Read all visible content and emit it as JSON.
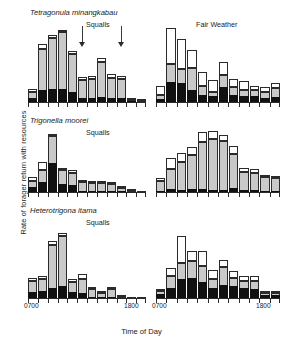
{
  "figure": {
    "ylabel": "Rate of forager return with resources",
    "xlabel": "Time of Day",
    "xtick_start": "0700",
    "xtick_end": "1800",
    "colors": {
      "pollen_black": "#111111",
      "nectar_gray": "#c9c9c9",
      "empty_white": "#ffffff",
      "axis": "#2b2b2b"
    }
  },
  "conditions": {
    "squalls": "Squalls",
    "fair_weather": "Fair Weather"
  },
  "species": [
    "Tetragonula minangkabau",
    "Trigonella moorei",
    "Heterotrigona itama"
  ],
  "chart_data": {
    "type": "bar",
    "title": "",
    "xlabel": "Time of Day",
    "ylabel": "Rate of forager return with resources",
    "stacked": true,
    "grid": false,
    "legend_position": "none",
    "xlim": [
      "0700",
      "1800"
    ],
    "ylim": [
      0,
      100
    ],
    "series_names": [
      "black",
      "gray",
      "white"
    ],
    "panels": [
      {
        "species": "Tetragonula minangkabau",
        "condition": "Squalls",
        "arrows": [
          {
            "label": "squall onset",
            "bar_index": 5
          },
          {
            "label": "squall onset",
            "bar_index": 9
          }
        ],
        "categories": [
          "0700",
          "0800",
          "0900",
          "1000",
          "1100",
          "1200",
          "1300",
          "1400",
          "1500",
          "1600",
          "1700",
          "1800"
        ],
        "series": [
          {
            "name": "black",
            "values": [
              6,
              16,
              17,
              18,
              14,
              6,
              6,
              7,
              6,
              6,
              1,
              0
            ]
          },
          {
            "name": "gray",
            "values": [
              7,
              56,
              70,
              76,
              51,
              24,
              25,
              47,
              26,
              25,
              2,
              1
            ]
          },
          {
            "name": "white",
            "values": [
              4,
              6,
              4,
              4,
              4,
              4,
              4,
              5,
              6,
              4,
              2,
              1
            ]
          }
        ]
      },
      {
        "species": "Tetragonula minangkabau",
        "condition": "Fair Weather",
        "arrows": [],
        "categories": [
          "0700",
          "0800",
          "0900",
          "1000",
          "1100",
          "1200",
          "1300",
          "1400",
          "1500",
          "1600",
          "1700",
          "1800"
        ],
        "series": [
          {
            "name": "black",
            "values": [
              4,
              27,
              26,
              16,
              10,
              8,
              20,
              10,
              8,
              8,
              6,
              7
            ]
          },
          {
            "name": "gray",
            "values": [
              6,
              25,
              19,
              30,
              11,
              6,
              16,
              10,
              8,
              8,
              8,
              12
            ]
          },
          {
            "name": "white",
            "values": [
              12,
              48,
              40,
              24,
              20,
              16,
              18,
              11,
              12,
              6,
              6,
              7
            ]
          }
        ]
      },
      {
        "species": "Trigonella moorei",
        "condition": "Squalls",
        "arrows": [],
        "categories": [
          "0700",
          "0800",
          "0900",
          "1000",
          "1100",
          "1200",
          "1300",
          "1400",
          "1500",
          "1600",
          "1700",
          "1800"
        ],
        "series": [
          {
            "name": "black",
            "values": [
              8,
              16,
              46,
              13,
              11,
              2,
              2,
              2,
              2,
              1,
              0,
              0
            ]
          },
          {
            "name": "gray",
            "values": [
              10,
              20,
              44,
              22,
              20,
              14,
              13,
              12,
              11,
              5,
              1,
              0
            ]
          },
          {
            "name": "white",
            "values": [
              6,
              12,
              4,
              4,
              4,
              3,
              3,
              3,
              3,
              3,
              1,
              0
            ]
          }
        ]
      },
      {
        "species": "Trigonella moorei",
        "condition": "Fair Weather",
        "arrows": [],
        "categories": [
          "0700",
          "0800",
          "0900",
          "1000",
          "1100",
          "1200",
          "1300",
          "1400",
          "1500",
          "1600",
          "1700",
          "1800"
        ],
        "series": [
          {
            "name": "black",
            "values": [
              2,
              5,
              3,
              5,
              5,
              4,
              4,
              6,
              3,
              3,
              2,
              2
            ]
          },
          {
            "name": "gray",
            "values": [
              16,
              32,
              46,
              55,
              76,
              82,
              78,
              56,
              30,
              28,
              22,
              21
            ]
          },
          {
            "name": "white",
            "values": [
              4,
              18,
              14,
              12,
              16,
              12,
              10,
              12,
              5,
              6,
              2,
              2
            ]
          }
        ]
      },
      {
        "species": "Heterotrigona itama",
        "condition": "Squalls",
        "arrows": [],
        "categories": [
          "0700",
          "0800",
          "0900",
          "1000",
          "1100",
          "1200",
          "1300",
          "1400",
          "1500",
          "1600",
          "1700",
          "1800"
        ],
        "series": [
          {
            "name": "black",
            "values": [
              9,
              10,
              14,
              16,
              8,
              7,
              2,
              1,
              2,
              0,
              0,
              0
            ]
          },
          {
            "name": "gray",
            "values": [
              14,
              16,
              60,
              70,
              14,
              20,
              10,
              6,
              10,
              1,
              0,
              0
            ]
          },
          {
            "name": "white",
            "values": [
              5,
              5,
              5,
              5,
              4,
              6,
              4,
              3,
              4,
              1,
              0,
              0
            ]
          }
        ]
      },
      {
        "species": "Heterotrigona itama",
        "condition": "Fair Weather",
        "arrows": [],
        "categories": [
          "0700",
          "0800",
          "0900",
          "1000",
          "1100",
          "1200",
          "1300",
          "1400",
          "1500",
          "1600",
          "1700",
          "1800"
        ],
        "series": [
          {
            "name": "black",
            "values": [
              6,
              14,
              26,
              28,
              22,
              14,
              18,
              16,
              14,
              12,
              4,
              4
            ]
          },
          {
            "name": "gray",
            "values": [
              4,
              16,
              22,
              24,
              22,
              13,
              25,
              12,
              10,
              11,
              3,
              3
            ]
          },
          {
            "name": "white",
            "values": [
              2,
              12,
              38,
              14,
              22,
              12,
              10,
              10,
              6,
              8,
              2,
              2
            ]
          }
        ]
      }
    ]
  }
}
